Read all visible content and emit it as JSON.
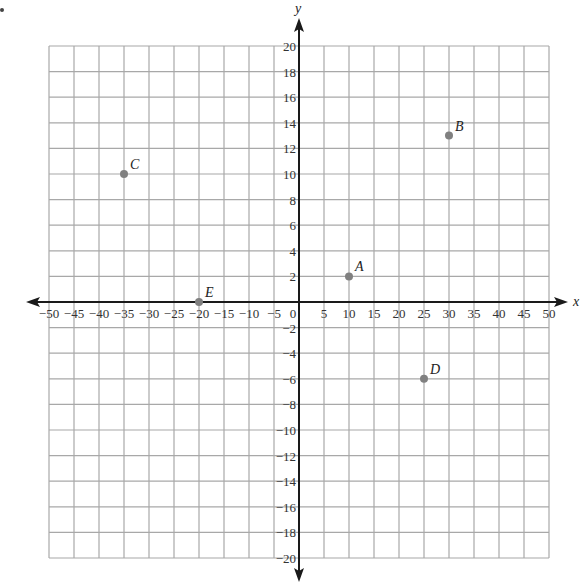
{
  "chart_data": {
    "type": "scatter",
    "title": "",
    "xlabel": "x",
    "ylabel": "y",
    "xlim": [
      -50,
      50
    ],
    "ylim": [
      -20,
      20
    ],
    "grid": true,
    "x_ticks": [
      -50,
      -45,
      -40,
      -35,
      -30,
      -25,
      -20,
      -15,
      -10,
      -5,
      0,
      5,
      10,
      15,
      20,
      25,
      30,
      35,
      40,
      45,
      50
    ],
    "x_tick_labels": [
      "−50",
      "−45",
      "−40",
      "−35",
      "−30",
      "−25",
      "−20",
      "−15",
      "−10",
      "−5",
      "0",
      "5",
      "10",
      "15",
      "20",
      "25",
      "30",
      "35",
      "40",
      "45",
      "50"
    ],
    "y_ticks": [
      20,
      18,
      16,
      14,
      12,
      10,
      8,
      6,
      4,
      2,
      -2,
      -4,
      -6,
      -8,
      -10,
      -12,
      -14,
      -16,
      -18,
      -20
    ],
    "y_tick_labels": [
      "20",
      "18",
      "16",
      "14",
      "12",
      "10",
      "8",
      "6",
      "4",
      "2",
      "−2",
      "−4",
      "−6",
      "−8",
      "−10",
      "−12",
      "−14",
      "−16",
      "−18",
      "−20"
    ],
    "points": [
      {
        "label": "A",
        "x": 10,
        "y": 2
      },
      {
        "label": "B",
        "x": 30,
        "y": 13
      },
      {
        "label": "C",
        "x": -35,
        "y": 10
      },
      {
        "label": "D",
        "x": 25,
        "y": -6
      },
      {
        "label": "E",
        "x": -20,
        "y": 0
      }
    ],
    "legend": null
  },
  "colors": {
    "grid": "#a8a8a8",
    "axis": "#1a1a1a",
    "point": "#808080"
  }
}
